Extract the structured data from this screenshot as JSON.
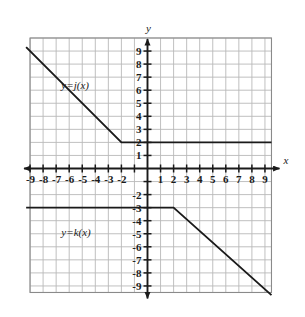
{
  "chart_data": {
    "type": "line",
    "title": "",
    "xlabel": "x",
    "ylabel": "y",
    "xlim": [
      -9.6,
      9.6
    ],
    "ylim": [
      -9.8,
      10.2
    ],
    "grid": true,
    "grid_step": 1,
    "legend": "inline-labels",
    "x_tick_labels": [
      "-9",
      "-8",
      "-7",
      "-6",
      "-5",
      "-4",
      "-3",
      "-2",
      "1",
      "2",
      "3",
      "4",
      "5",
      "6",
      "7",
      "8",
      "9"
    ],
    "x_tick_values": [
      -9,
      -8,
      -7,
      -6,
      -5,
      -4,
      -3,
      -2,
      1,
      2,
      3,
      4,
      5,
      6,
      7,
      8,
      9
    ],
    "y_tick_labels": [
      "9",
      "8",
      "7",
      "6",
      "5",
      "4",
      "3",
      "2",
      "1",
      "-2",
      "-3",
      "-4",
      "-5",
      "-6",
      "-7",
      "-8",
      "-9"
    ],
    "y_tick_values": [
      9,
      8,
      7,
      6,
      5,
      4,
      3,
      2,
      1,
      -2,
      -3,
      -4,
      -5,
      -6,
      -7,
      -8,
      -9
    ],
    "series": [
      {
        "name": "y=j(x)",
        "label": "y=j(x)",
        "label_x": -6.6,
        "label_y": 6.4,
        "points": [
          {
            "x": -9.3,
            "y": 9.3
          },
          {
            "x": -2,
            "y": 2
          },
          {
            "x": 9.5,
            "y": 2
          }
        ],
        "vertex": {
          "x": -2,
          "y": 2
        },
        "color": "#1a1a1a"
      },
      {
        "name": "y=k(x)",
        "label": "y=k(x)",
        "label_x": -6.6,
        "label_y": -4.9,
        "points": [
          {
            "x": -9.3,
            "y": -3
          },
          {
            "x": 2,
            "y": -3
          },
          {
            "x": 9.5,
            "y": -9.7
          }
        ],
        "vertex": {
          "x": 2,
          "y": -3
        },
        "color": "#1a1a1a"
      }
    ]
  },
  "axes": {
    "x_axis_label": "x",
    "y_axis_label": "y"
  },
  "colors": {
    "grid_line": "#b9b9b9",
    "grid_border": "#8a8a8a",
    "axis": "#1a1a1a",
    "curve": "#1a1a1a",
    "background": "#ffffff"
  }
}
